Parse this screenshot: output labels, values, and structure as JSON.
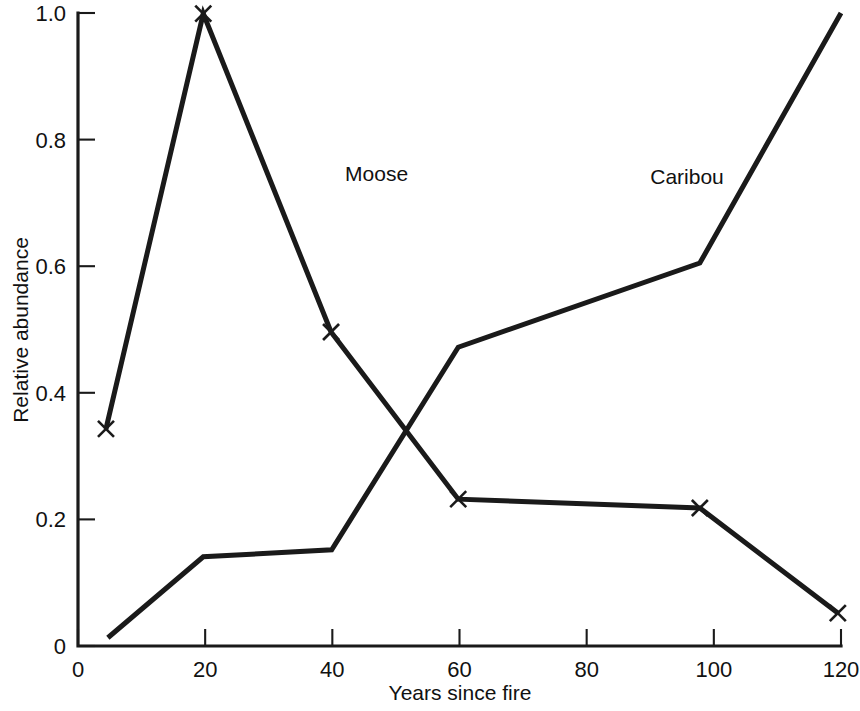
{
  "chart_data": {
    "type": "line",
    "title": "",
    "xlabel": "Years since fire",
    "ylabel": "Relative abundance",
    "xlim": [
      0,
      120
    ],
    "ylim": [
      0,
      1.0
    ],
    "xticks": [
      0,
      20,
      40,
      60,
      80,
      100,
      120
    ],
    "xticklabels": [
      "0",
      "20",
      "40",
      "60",
      "80",
      "100",
      "120"
    ],
    "yticks": [
      0,
      0.2,
      0.4,
      0.6,
      0.8,
      1.0
    ],
    "yticklabels": [
      "0",
      "0.2",
      "0.4",
      "0.6",
      "0.8",
      "1.0"
    ],
    "grid": false,
    "legend": "inline-annotations",
    "series": [
      {
        "name": "Moose",
        "marker": "x",
        "label_x": 42,
        "label_y": 0.735,
        "x": [
          4.4,
          19.7,
          39.8,
          59.8,
          97.8,
          119.5
        ],
        "y": [
          0.343,
          0.999,
          0.496,
          0.232,
          0.218,
          0.052
        ]
      },
      {
        "name": "Caribou",
        "marker": "none",
        "label_x": 90,
        "label_y": 0.73,
        "x": [
          4.7,
          19.7,
          39.9,
          59.8,
          97.8,
          120
        ],
        "y": [
          0.013,
          0.141,
          0.152,
          0.472,
          0.605,
          1.0
        ]
      }
    ]
  },
  "annotations": {
    "moose_label": "Moose",
    "caribou_label": "Caribou"
  }
}
